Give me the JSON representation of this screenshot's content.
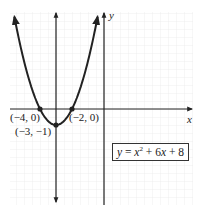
{
  "chart_data": {
    "type": "line",
    "title": "",
    "equation": "y = x^2 + 6x + 8",
    "equation_display": {
      "lhs": "y",
      "eq": " = ",
      "x": "x",
      "exp": "2",
      "rest": " + 6",
      "x2": "x",
      "tail": " + 8"
    },
    "xlabel": "x",
    "ylabel": "y",
    "xlim": [
      -5.9,
      5.6
    ],
    "ylim": [
      -6.0,
      6.1
    ],
    "grid": true,
    "legend": null,
    "series": [
      {
        "name": "y = x^2 + 6x + 8",
        "function": "x^2 + 6x + 8",
        "x": [
          -5.65,
          -5,
          -4,
          -3.5,
          -3,
          -2.5,
          -2,
          -1,
          -0.4
        ],
        "y": [
          6.0,
          3,
          0,
          -0.75,
          -1,
          -0.75,
          0,
          3,
          5.76
        ]
      }
    ],
    "axis_of_symmetry": {
      "x": -3
    },
    "points": [
      {
        "x": -4,
        "y": 0,
        "label": "(−4, 0)"
      },
      {
        "x": -2,
        "y": 0,
        "label": "(−2, 0)"
      },
      {
        "x": -3,
        "y": -1,
        "label": "(−3, −1)"
      }
    ],
    "annotations": [
      "(−4, 0)",
      "(−2, 0)",
      "(−3, −1)",
      "y = x² + 6x + 8"
    ]
  },
  "colors": {
    "curve": "#222222",
    "axis": "#222222",
    "grid": "#ececec",
    "background": "#ffffff"
  }
}
